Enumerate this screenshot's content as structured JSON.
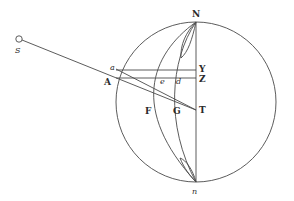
{
  "figure": {
    "type": "geometric-diagram",
    "line_color": "#4a4a4a",
    "label_color": "#2a2a2a",
    "circle": {
      "cx": 196,
      "cy": 102,
      "r": 80
    },
    "points": {
      "S": {
        "label": "S",
        "x": 19,
        "y": 39
      },
      "N": {
        "label": "N",
        "x": 196,
        "y": 22
      },
      "n": {
        "label": "n",
        "x": 196,
        "y": 182
      },
      "Y": {
        "label": "Y",
        "x": 196,
        "y": 70
      },
      "Z": {
        "label": "Z",
        "x": 196,
        "y": 78
      },
      "T": {
        "label": "T",
        "x": 196,
        "y": 110
      },
      "a": {
        "label": "a",
        "x": 116,
        "y": 69
      },
      "A": {
        "label": "A",
        "x": 113,
        "y": 78
      },
      "e": {
        "label": "e",
        "x": 162,
        "y": 78
      },
      "d": {
        "label": "d",
        "x": 178,
        "y": 78
      },
      "F": {
        "label": "F",
        "x": 150,
        "y": 110
      },
      "G": {
        "label": "G",
        "x": 176,
        "y": 112
      }
    }
  }
}
